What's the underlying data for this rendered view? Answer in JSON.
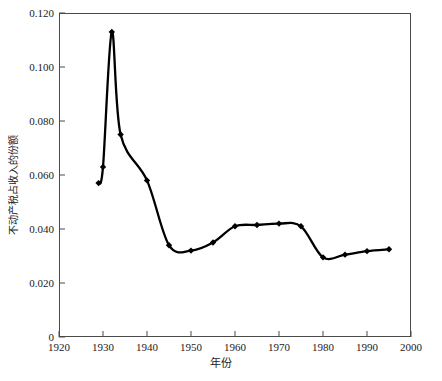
{
  "chart_data": {
    "type": "line",
    "title": "",
    "subtitle": "",
    "xlabel": "年份",
    "ylabel": "不动产税占收入的份额",
    "xlim": [
      1920,
      2000
    ],
    "ylim": [
      0,
      0.12
    ],
    "xticks": [
      "1920",
      "1930",
      "1940",
      "1950",
      "1960",
      "1970",
      "1980",
      "1990",
      "2000"
    ],
    "xtick_values": [
      1920,
      1930,
      1940,
      1950,
      1960,
      1970,
      1980,
      1990,
      2000
    ],
    "yticks": [
      "0",
      "0.020",
      "0.040",
      "0.060",
      "0.080",
      "0.100",
      "0.120"
    ],
    "ytick_values": [
      0,
      0.02,
      0.04,
      0.06,
      0.08,
      0.1,
      0.12
    ],
    "grid": false,
    "legend": "none",
    "marker": "diamond",
    "line_color": "#000000",
    "marker_color": "#000000",
    "frame_color": "#4a4a4a",
    "background": "#ffffff",
    "series": [
      {
        "name": "不动产税占收入的份额",
        "x": [
          1929,
          1930,
          1932,
          1934,
          1940,
          1945,
          1950,
          1955,
          1960,
          1965,
          1970,
          1975,
          1980,
          1985,
          1990,
          1995
        ],
        "values": [
          0.057,
          0.063,
          0.113,
          0.075,
          0.058,
          0.034,
          0.032,
          0.035,
          0.041,
          0.0415,
          0.042,
          0.041,
          0.0295,
          0.0305,
          0.0318,
          0.0325
        ]
      }
    ],
    "annotations": []
  }
}
